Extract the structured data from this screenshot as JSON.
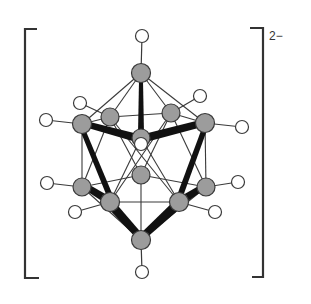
{
  "diagram": {
    "charge_label": "2−",
    "colors": {
      "boron_fill": "#9c9c9c",
      "hydrogen_fill": "#ffffff",
      "outline": "#3a3a3a",
      "bond": "#3a3a3a",
      "wedge": "#111111",
      "bracket": "#333333"
    },
    "boron_atoms": [
      {
        "id": "B1",
        "x": 141,
        "y": 73
      },
      {
        "id": "B2",
        "x": 82,
        "y": 124
      },
      {
        "id": "B3",
        "x": 110,
        "y": 117
      },
      {
        "id": "B4",
        "x": 171,
        "y": 113
      },
      {
        "id": "B5",
        "x": 205,
        "y": 123
      },
      {
        "id": "B6",
        "x": 141,
        "y": 138
      },
      {
        "id": "B7",
        "x": 82,
        "y": 187
      },
      {
        "id": "B8",
        "x": 110,
        "y": 202
      },
      {
        "id": "B9",
        "x": 141,
        "y": 175
      },
      {
        "id": "B10",
        "x": 179,
        "y": 202
      },
      {
        "id": "B11",
        "x": 206,
        "y": 187
      },
      {
        "id": "B12",
        "x": 141,
        "y": 240
      }
    ],
    "hydrogen_atoms": [
      {
        "id": "H1",
        "x": 142,
        "y": 36,
        "bonded_to": "B1"
      },
      {
        "id": "H2",
        "x": 46,
        "y": 120,
        "bonded_to": "B2"
      },
      {
        "id": "H3",
        "x": 80,
        "y": 103,
        "bonded_to": "B3"
      },
      {
        "id": "H4",
        "x": 200,
        "y": 96,
        "bonded_to": "B4"
      },
      {
        "id": "H5",
        "x": 242,
        "y": 127,
        "bonded_to": "B5"
      },
      {
        "id": "H6",
        "x": 141,
        "y": 144,
        "bonded_to": "B6"
      },
      {
        "id": "H7",
        "x": 47,
        "y": 183,
        "bonded_to": "B7"
      },
      {
        "id": "H8",
        "x": 75,
        "y": 212,
        "bonded_to": "B8"
      },
      {
        "id": "H10",
        "x": 215,
        "y": 212,
        "bonded_to": "B10"
      },
      {
        "id": "H11",
        "x": 238,
        "y": 182,
        "bonded_to": "B11"
      },
      {
        "id": "H12",
        "x": 142,
        "y": 272,
        "bonded_to": "B12"
      }
    ]
  }
}
